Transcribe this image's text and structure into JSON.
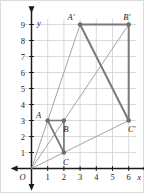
{
  "figure": {
    "frame_border_color": "#d8d8d8",
    "grid_color": "#d0d0d0",
    "axis_color": "#1a1a1a",
    "shape_color": "#7a7a7a",
    "ray_color": "#9a9a9a",
    "vertex_color": "#6e6e6e",
    "background": "#ffffff"
  },
  "axes": {
    "x_label": "x",
    "y_label": "y",
    "origin_label": "O",
    "x_ticks": [
      "1",
      "2",
      "3",
      "4",
      "5",
      "6"
    ],
    "y_ticks": [
      "1",
      "2",
      "3",
      "4",
      "5",
      "6",
      "7",
      "8",
      "9"
    ],
    "x_range": [
      0,
      6
    ],
    "y_range": [
      0,
      9
    ],
    "grid": true
  },
  "chart_data": {
    "type": "scatter",
    "xlabel": "x",
    "ylabel": "y",
    "xlim": [
      0,
      6
    ],
    "ylim": [
      0,
      9
    ],
    "grid": true,
    "scale_factor": 3,
    "center_of_dilation": {
      "x": 0,
      "y": 0,
      "label": "O"
    },
    "series": [
      {
        "name": "Triangle ABC",
        "points": [
          {
            "label": "A",
            "x": 1,
            "y": 3,
            "label_dx": -9,
            "label_dy": -3
          },
          {
            "label": "B",
            "x": 2,
            "y": 3,
            "label_dx": 2,
            "label_dy": 11
          },
          {
            "label": "C",
            "x": 2,
            "y": 1,
            "label_dx": 2,
            "label_dy": 12
          }
        ],
        "edges": [
          [
            "A",
            "B"
          ],
          [
            "B",
            "C"
          ],
          [
            "C",
            "A"
          ]
        ]
      },
      {
        "name": "Triangle A'B'C'",
        "points": [
          {
            "label": "A'",
            "x": 3,
            "y": 9,
            "label_dx": -9,
            "label_dy": -5
          },
          {
            "label": "B'",
            "x": 6,
            "y": 9,
            "label_dx": -2,
            "label_dy": -5
          },
          {
            "label": "C'",
            "x": 6,
            "y": 3,
            "label_dx": 3,
            "label_dy": 11
          }
        ],
        "edges": [
          [
            "A'",
            "B'"
          ],
          [
            "B'",
            "C'"
          ],
          [
            "C'",
            "A'"
          ]
        ]
      }
    ],
    "rays": [
      {
        "from": "O",
        "through": "A",
        "to": "A'"
      },
      {
        "from": "O",
        "through": "B",
        "to": "B'"
      },
      {
        "from": "O",
        "through": "C",
        "to": "C'"
      }
    ]
  },
  "labels": {
    "A": "A",
    "B": "B",
    "C": "C",
    "A_prime": "A'",
    "B_prime": "B'",
    "C_prime": "C'"
  }
}
